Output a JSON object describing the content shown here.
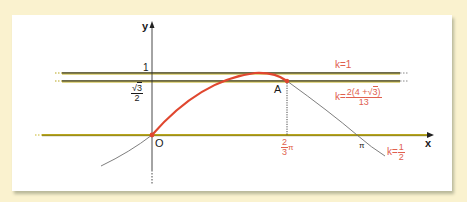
{
  "diagram": {
    "axes": {
      "x_label": "x",
      "y_label": "y",
      "origin_label": "O"
    },
    "y_ticks": {
      "one": "1",
      "sqrt3_over_2_num": "3",
      "sqrt3_over_2_den": "2"
    },
    "x_ticks": {
      "two_thirds_pi_num": "2",
      "two_thirds_pi_den": "3",
      "two_thirds_pi_suffix": "π",
      "pi": "π"
    },
    "point_A": "A",
    "lines": [
      {
        "label": "k=1"
      },
      {
        "label_prefix": "k=",
        "numerator_left": "2(4 +",
        "numerator_sqrt": "3",
        "numerator_right": ")",
        "denominator": "13"
      },
      {
        "label_prefix": "k=",
        "numerator": "1",
        "denominator": "2"
      }
    ],
    "colors": {
      "background": "#faf2cf",
      "panel": "#ffffff",
      "horizontal_lines": "#b7a51c",
      "red_curve": "#e0472f",
      "gray_curve": "#6f6f6f",
      "label_red": "#e0604e"
    }
  }
}
